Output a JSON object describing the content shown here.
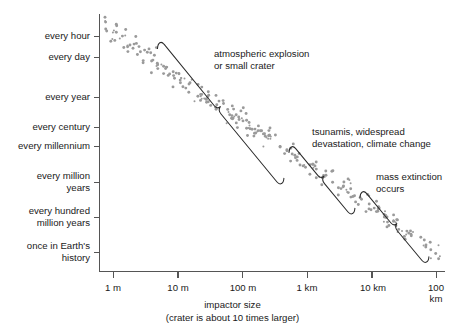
{
  "chart_data": {
    "type": "scatter",
    "title": "",
    "xlabel": "impactor size",
    "xlabel_sub": "(crater is about 10 times larger)",
    "ylabel": "",
    "x_ticks": [
      "1 m",
      "10 m",
      "100 m",
      "1 km",
      "10 km",
      "100 km"
    ],
    "x_tick_values": [
      1,
      10,
      100,
      1000,
      10000,
      100000
    ],
    "y_ticks": [
      "every hour",
      "every day",
      "every year",
      "every century",
      "every millennium",
      "every million\nyears",
      "every hundred\nmillion years",
      "once in Earth's\nhistory"
    ],
    "y_tick_values": [
      1,
      2,
      4,
      6,
      7,
      9,
      11,
      13
    ],
    "grid": false,
    "legend": null,
    "xlim": [
      1,
      100000
    ],
    "ylim_note": "log frequency axis, decreasing downward",
    "series": [
      {
        "name": "impact events",
        "marker": "small gray dot",
        "color": "#9a9a9a",
        "n_points": 260,
        "trend": "power law, frequency decreases about 3 decades per decade of size"
      }
    ],
    "annotations": [
      {
        "id": "annotation-atmospheric-explosion",
        "text": "atmospheric explosion\nor small crater",
        "brace_span_x": [
          "~3 m",
          "~500 m"
        ],
        "brace_span_label": "small impactors"
      },
      {
        "id": "annotation-tsunamis",
        "text": "tsunamis, widespread\ndevastation, climate change",
        "brace_span_x": [
          "~700 m",
          "~6 km"
        ],
        "brace_span_label": "mid-size impactors"
      },
      {
        "id": "annotation-mass-extinction",
        "text": "mass extinction\noccurs",
        "brace_span_x": [
          "~7 km",
          "~100 km"
        ],
        "brace_span_label": "largest impactors"
      }
    ],
    "colors": {
      "dot": "#9a9a9a",
      "axis": "#555555",
      "brace": "#2b2b2b",
      "text": "#1a1a1a",
      "background": "#ffffff"
    }
  }
}
